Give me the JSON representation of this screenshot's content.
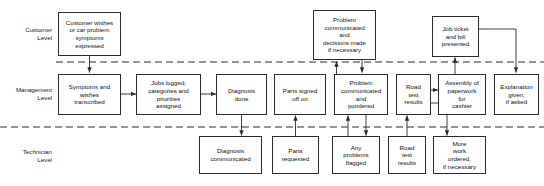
{
  "diagram": {
    "type": "service-blueprint-flowchart",
    "colors": {
      "background": "#ffffff",
      "box_border": "#2b2b2b",
      "text": "#101010",
      "connector": "#2b2b2b",
      "dashed_line": "#2b2b2b"
    },
    "lanes": [
      {
        "id": "customer",
        "label": "Customer\nLevel"
      },
      {
        "id": "management",
        "label": "Management\nLevel"
      },
      {
        "id": "technician",
        "label": "Technician\nLevel"
      }
    ],
    "dividers": [
      {
        "id": "line-of-interaction",
        "y": 62,
        "style": "dashed"
      },
      {
        "id": "line-of-internal-interaction",
        "y": 127,
        "style": "dashed"
      }
    ],
    "nodes": [
      {
        "id": "customer-wishes",
        "lane": "customer",
        "label": "Customer wishes\nor car problem\nsymptoms\nexpressed",
        "x": 58,
        "y": 12,
        "w": 63,
        "h": 44
      },
      {
        "id": "problem-communicated-decisions",
        "lane": "customer",
        "label": "Problem\ncommunicated\nand\ndecisions made\nif necessary",
        "x": 313,
        "y": 10,
        "w": 63,
        "h": 50
      },
      {
        "id": "job-ticket-bill",
        "lane": "customer",
        "label": "Job ticket\nand bill\npresented",
        "x": 432,
        "y": 16,
        "w": 47,
        "h": 40
      },
      {
        "id": "symptoms-transcribed",
        "lane": "management",
        "label": "Symptoms and\nwishes\ntranscribed",
        "x": 58,
        "y": 74,
        "w": 63,
        "h": 40
      },
      {
        "id": "jobs-logged",
        "lane": "management",
        "label": "Jobs logged,\ncategories and\npriorities\nassigned",
        "x": 138,
        "y": 74,
        "w": 63,
        "h": 40
      },
      {
        "id": "diagnosis-done",
        "lane": "management",
        "label": "Diagnosis\ndone",
        "x": 218,
        "y": 74,
        "w": 47,
        "h": 40
      },
      {
        "id": "parts-signed-off",
        "lane": "management",
        "label": "Parts signed\noff on",
        "x": 276,
        "y": 74,
        "w": 52,
        "h": 40
      },
      {
        "id": "problem-communicated-pondered",
        "lane": "management",
        "label": "Problem\ncommunicated\nand\npondered",
        "x": 336,
        "y": 74,
        "w": 54,
        "h": 40
      },
      {
        "id": "road-test-results-mgmt",
        "lane": "management",
        "label": "Road\ntest\nresults",
        "x": 398,
        "y": 74,
        "w": 33,
        "h": 40
      },
      {
        "id": "assembly-paperwork",
        "lane": "management",
        "label": "Assembly of\npaperwork\nfor\ncashier",
        "x": 440,
        "y": 74,
        "w": 48,
        "h": 40
      },
      {
        "id": "explanation-given",
        "lane": "management",
        "label": "Explanation\ngiven,\nif asked",
        "x": 495,
        "y": 74,
        "w": 44,
        "h": 40
      },
      {
        "id": "diagnosis-communicated",
        "lane": "technician",
        "label": "Diagnosis\ncommunicated",
        "x": 198,
        "y": 137,
        "w": 63,
        "h": 38
      },
      {
        "id": "parts-requested",
        "lane": "technician",
        "label": "Parts\nrequested",
        "x": 272,
        "y": 137,
        "w": 47,
        "h": 38
      },
      {
        "id": "any-problems-flagged",
        "lane": "technician",
        "label": "Any\nproblems\nflagged",
        "x": 332,
        "y": 137,
        "w": 47,
        "h": 38
      },
      {
        "id": "road-test-results-tech",
        "lane": "technician",
        "label": "Road\ntest\nresults",
        "x": 388,
        "y": 137,
        "w": 38,
        "h": 38
      },
      {
        "id": "more-work-ordered",
        "lane": "technician",
        "label": "More\nwork\nordered,\nif necessary",
        "x": 434,
        "y": 137,
        "w": 52,
        "h": 38
      }
    ],
    "connectors": [
      {
        "id": "customer-wishes-to-symptoms",
        "from": "customer-wishes",
        "to": "symptoms-transcribed",
        "direction": "down"
      },
      {
        "id": "symptoms-to-jobs-logged",
        "from": "symptoms-transcribed",
        "to": "jobs-logged",
        "direction": "right"
      },
      {
        "id": "jobs-logged-to-diagnosis",
        "from": "jobs-logged",
        "to": "diagnosis-done",
        "direction": "right"
      },
      {
        "id": "diagnosis-done-to-diagnosis-communicated",
        "from": "diagnosis-done",
        "to": "diagnosis-communicated",
        "direction": "down"
      },
      {
        "id": "parts-requested-to-parts-signed-off",
        "from": "parts-requested",
        "to": "parts-signed-off",
        "direction": "up"
      },
      {
        "id": "any-problems-to-problem-pondered",
        "from": "any-problems-flagged",
        "to": "problem-communicated-pondered",
        "direction": "up"
      },
      {
        "id": "problem-pondered-to-any-problems",
        "from": "problem-communicated-pondered",
        "to": "any-problems-flagged",
        "direction": "down"
      },
      {
        "id": "problem-pondered-to-customer-problem",
        "from": "problem-communicated-pondered",
        "to": "problem-communicated-decisions",
        "direction": "up"
      },
      {
        "id": "customer-problem-to-road-test",
        "from": "problem-communicated-decisions",
        "to": "road-test-results-mgmt",
        "direction": "down"
      },
      {
        "id": "road-test-tech-to-road-test-mgmt",
        "from": "road-test-results-tech",
        "to": "road-test-results-mgmt",
        "direction": "up"
      },
      {
        "id": "road-test-to-assembly",
        "from": "road-test-results-mgmt",
        "to": "assembly-paperwork",
        "direction": "right"
      },
      {
        "id": "road-test-to-more-work",
        "from": "road-test-results-mgmt",
        "to": "more-work-ordered",
        "direction": "down"
      },
      {
        "id": "assembly-to-job-ticket",
        "from": "assembly-paperwork",
        "to": "job-ticket-bill",
        "direction": "up"
      },
      {
        "id": "job-ticket-to-explanation",
        "from": "job-ticket-bill",
        "to": "explanation-given",
        "direction": "down"
      }
    ]
  }
}
